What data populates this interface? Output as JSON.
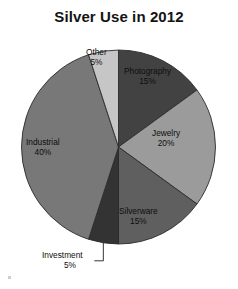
{
  "chart_data": {
    "type": "pie",
    "title": "Silver Use in 2012",
    "categories": [
      "Photography",
      "Jewelry",
      "Silverware",
      "Investment",
      "Industrial",
      "Other"
    ],
    "values": [
      15,
      20,
      15,
      5,
      40,
      5
    ],
    "value_suffix": "%",
    "start_angle_deg": 0,
    "direction": "clockwise",
    "legend": "none",
    "labels_position": "inside-slices",
    "slices": [
      {
        "label": "Photography",
        "value": 15,
        "value_text": "15%",
        "color": "#424242",
        "leader": false
      },
      {
        "label": "Jewelry",
        "value": 20,
        "value_text": "20%",
        "color": "#9b9b9b",
        "leader": false
      },
      {
        "label": "Silverware",
        "value": 15,
        "value_text": "15%",
        "color": "#5f5f5f",
        "leader": false
      },
      {
        "label": "Investment",
        "value": 5,
        "value_text": "5%",
        "color": "#333333",
        "leader": true
      },
      {
        "label": "Industrial",
        "value": 40,
        "value_text": "40%",
        "color": "#787878",
        "leader": false
      },
      {
        "label": "Other",
        "value": 5,
        "value_text": "5%",
        "color": "#c6c6c6",
        "leader": false
      }
    ]
  },
  "chart": {
    "title": "Silver Use in 2012",
    "outline_color": "#2b2b2b",
    "leader_color": "#1f1f1f",
    "labels": {
      "photography": {
        "name": "Photography",
        "value": "15%"
      },
      "jewelry": {
        "name": "Jewelry",
        "value": "20%"
      },
      "silverware": {
        "name": "Silverware",
        "value": "15%"
      },
      "investment": {
        "name": "Investment",
        "value": "5%"
      },
      "industrial": {
        "name": "Industrial",
        "value": "40%"
      },
      "other": {
        "name": "Other",
        "value": "5%"
      }
    }
  }
}
